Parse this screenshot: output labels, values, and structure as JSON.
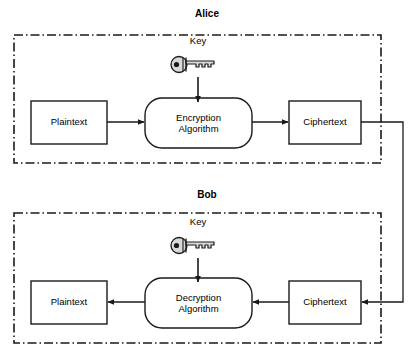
{
  "diagram": {
    "colors": {
      "stroke": "#1a1a1a",
      "boundary": "#1a1a1a",
      "background": "#ffffff",
      "key_body": "#d8d8d8",
      "key_outline": "#1a1a1a"
    },
    "sections": [
      {
        "id": "alice",
        "label": "Alice",
        "label_x": 198,
        "label_y": 14,
        "boundary": {
          "x": 14,
          "y": 35,
          "w": 367,
          "h": 128
        },
        "key": {
          "label": "Key",
          "label_x": 198,
          "label_y": 41,
          "icon_name": "key-icon",
          "icon_x": 171,
          "icon_y": 56,
          "icon_w": 46,
          "icon_h": 17,
          "arrow_x": 198,
          "arrow_y1": 77,
          "arrow_y2": 103
        },
        "nodes": [
          {
            "id": "alice-plaintext",
            "label": "Plaintext",
            "shape": "rect",
            "x": 31,
            "y": 101,
            "w": 76,
            "h": 43
          },
          {
            "id": "encryption-algorithm",
            "label_line1": "Encryption",
            "label_line2": "Algorithm",
            "shape": "rounded",
            "x": 145,
            "y": 98,
            "w": 107,
            "h": 50
          },
          {
            "id": "alice-ciphertext",
            "label": "Ciphertext",
            "shape": "rect",
            "x": 289,
            "y": 101,
            "w": 72,
            "h": 43
          }
        ],
        "arrows": [
          {
            "id": "alice-plaintext-to-encryption",
            "x1": 107,
            "y1": 122,
            "x2": 145,
            "y2": 122
          },
          {
            "id": "encryption-to-alice-ciphertext",
            "x1": 252,
            "y1": 122,
            "x2": 289,
            "y2": 122
          }
        ]
      },
      {
        "id": "bob",
        "label": "Bob",
        "label_x": 198,
        "label_y": 195,
        "boundary": {
          "x": 14,
          "y": 213,
          "w": 367,
          "h": 130
        },
        "key": {
          "label": "Key",
          "label_x": 198,
          "label_y": 222,
          "icon_name": "key-icon",
          "icon_x": 171,
          "icon_y": 237,
          "icon_w": 46,
          "icon_h": 17,
          "arrow_x": 198,
          "arrow_y1": 258,
          "arrow_y2": 283
        },
        "nodes": [
          {
            "id": "bob-plaintext",
            "label": "Plaintext",
            "shape": "rect",
            "x": 31,
            "y": 281,
            "w": 76,
            "h": 43
          },
          {
            "id": "decryption-algorithm",
            "label_line1": "Decryption",
            "label_line2": "Algorithm",
            "shape": "rounded",
            "x": 145,
            "y": 278,
            "w": 107,
            "h": 50
          },
          {
            "id": "bob-ciphertext",
            "label": "Ciphertext",
            "shape": "rect",
            "x": 289,
            "y": 281,
            "w": 72,
            "h": 43
          }
        ],
        "arrows": [
          {
            "id": "decryption-to-bob-plaintext",
            "x1": 145,
            "y1": 302,
            "x2": 107,
            "y2": 302
          },
          {
            "id": "bob-ciphertext-to-decryption",
            "x1": 289,
            "y1": 302,
            "x2": 252,
            "y2": 302
          }
        ]
      }
    ],
    "channel": {
      "id": "ciphertext-transmission-channel",
      "from_x": 361,
      "from_y": 122,
      "corner_x": 403,
      "to_y": 302,
      "to_x": 361
    }
  }
}
